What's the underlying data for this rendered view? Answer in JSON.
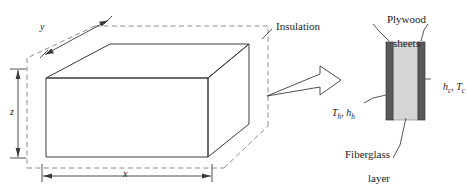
{
  "figure": {
    "colors": {
      "line": "#3a3a3a",
      "dashed": "#8c8c8c",
      "plywood": "#595959",
      "fiberglass": "#d5d5d5",
      "text": "#1b1b1b",
      "background": "#ffffff"
    }
  },
  "box": {
    "dimension_x": "x",
    "dimension_y": "y",
    "dimension_z": "z",
    "insulation_label": "Insulation"
  },
  "wall": {
    "plywood_label_line1": "Plywood",
    "plywood_label_line2": "sheets",
    "fiberglass_label_line1": "Fiberglass",
    "fiberglass_label_line2": "layer",
    "hot_side_symbol": "T",
    "hot_side_sub": "h",
    "hot_side_symbol2": "h",
    "hot_side_sub2": "h",
    "cold_side_symbol": "h",
    "cold_side_sub": "c",
    "cold_side_symbol2": "T",
    "cold_side_sub2": "c",
    "hot_side_full": "Th, hh",
    "cold_side_full": "hc, Tc"
  }
}
